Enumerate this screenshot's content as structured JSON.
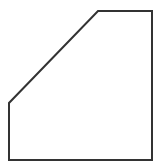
{
  "diagram": {
    "shape": "pentagon",
    "points": [
      [
        98,
        11
      ],
      [
        152,
        11
      ],
      [
        152,
        160
      ],
      [
        9,
        160
      ],
      [
        9,
        103
      ]
    ],
    "stroke_color": "#333333",
    "fill_color": "#ffffff",
    "stroke_width": 2
  }
}
